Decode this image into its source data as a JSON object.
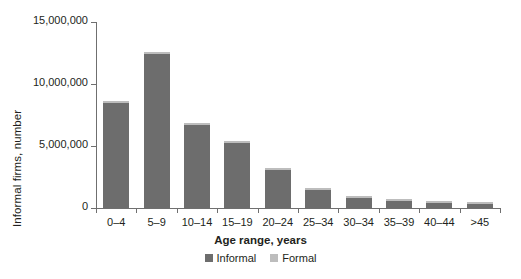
{
  "chart_data": {
    "type": "bar",
    "title": "",
    "xlabel": "Age range, years",
    "ylabel": "Informal firms, number",
    "categories": [
      "0–4",
      "5–9",
      "10–14",
      "15–19",
      "20–24",
      "25–34",
      "30–34",
      "35–39",
      "40–44",
      ">45"
    ],
    "series": [
      {
        "name": "Informal",
        "color": "#6d6d6d",
        "values": [
          8500000,
          12400000,
          6700000,
          5250000,
          3100000,
          1450000,
          800000,
          550000,
          420000,
          300000
        ]
      },
      {
        "name": "Formal",
        "color": "#bdbdbd",
        "values": [
          150000,
          150000,
          80000,
          70000,
          60000,
          50000,
          40000,
          35000,
          30000,
          25000
        ]
      }
    ],
    "stacked": true,
    "ylim": [
      0,
      15000000
    ],
    "yticks": [
      0,
      5000000,
      10000000,
      15000000
    ],
    "ytick_labels": [
      "0",
      "5,000,000",
      "10,000,000",
      "15,000,000"
    ],
    "grid": false,
    "legend_position": "bottom"
  },
  "axes": {
    "y_title": "Informal firms, number",
    "x_title": "Age range, years"
  },
  "legend": {
    "entries": [
      {
        "label": "Informal",
        "color": "#6d6d6d"
      },
      {
        "label": "Formal",
        "color": "#bdbdbd"
      }
    ]
  }
}
